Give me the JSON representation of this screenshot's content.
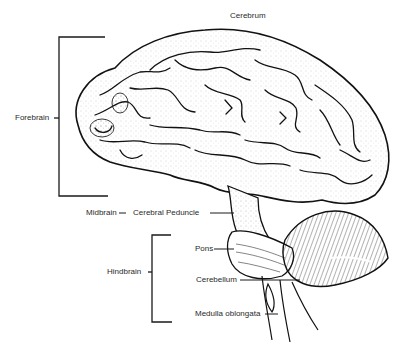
{
  "diagram": {
    "type": "anatomical-illustration",
    "labels": {
      "cerebrum": "Cerebrum",
      "forebrain": "Forebrain",
      "midbrain": "Midbrain",
      "cerebral_peduncle": "Cerebral Peduncle",
      "hindbrain": "Hindbrain",
      "pons": "Pons",
      "cerebellum": "Cerebellum",
      "medulla_oblongata": "Medulla oblongata"
    },
    "colors": {
      "ink": "#1a1a1a",
      "background": "#ffffff",
      "text": "#2a2a2a"
    }
  }
}
